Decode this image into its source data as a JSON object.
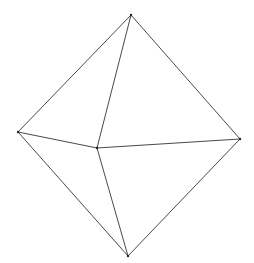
{
  "diagram": {
    "type": "octahedron-wireframe",
    "stroke_color": "#4a4a4a",
    "vertex_color": "#222222",
    "background": "#ffffff",
    "vertices": {
      "top": [
        131,
        15
      ],
      "left": [
        18,
        132
      ],
      "right": [
        240,
        139
      ],
      "center": [
        97,
        148
      ],
      "bottom": [
        128,
        256
      ]
    },
    "edges": [
      [
        "top",
        "left"
      ],
      [
        "top",
        "right"
      ],
      [
        "top",
        "center"
      ],
      [
        "left",
        "center"
      ],
      [
        "center",
        "right"
      ],
      [
        "left",
        "bottom"
      ],
      [
        "right",
        "bottom"
      ],
      [
        "center",
        "bottom"
      ]
    ]
  }
}
